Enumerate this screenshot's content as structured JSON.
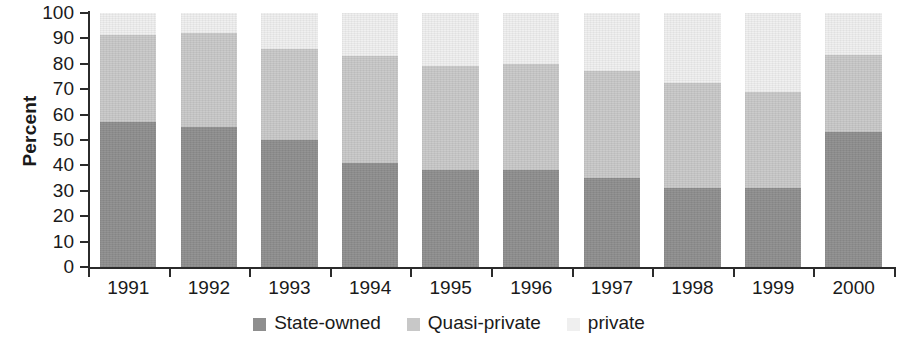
{
  "chart_data": {
    "type": "bar",
    "stacked": true,
    "title": "",
    "subtitle": "",
    "xlabel": "",
    "ylabel": "Percent",
    "ylim": [
      0,
      100
    ],
    "ytick_step": 10,
    "ytick_labels": [
      "100",
      "90",
      "80",
      "70",
      "60",
      "50",
      "40",
      "30",
      "20",
      "10",
      "0"
    ],
    "grid": false,
    "legend_position": "bottom-center",
    "categories": [
      "1991",
      "1992",
      "1993",
      "1994",
      "1995",
      "1996",
      "1997",
      "1998",
      "1999",
      "2000"
    ],
    "series": [
      {
        "name": "State-owned",
        "color": "#8e8e8e",
        "values": [
          57,
          55,
          50,
          41,
          38,
          38,
          35,
          31,
          31,
          53
        ]
      },
      {
        "name": "Quasi-private",
        "color": "#c8c8c8",
        "values": [
          34.5,
          37,
          36,
          42,
          41,
          42,
          42,
          41.5,
          38,
          30.5
        ]
      },
      {
        "name": "private",
        "color": "#efefef",
        "values": [
          8.5,
          8,
          14,
          17,
          21,
          20,
          23,
          27.5,
          31,
          16.5
        ]
      }
    ],
    "cumulative_tops": {
      "state_owned": [
        57,
        55,
        50,
        41,
        38,
        38,
        35,
        31,
        31,
        53
      ],
      "quasi_private_top": [
        91.5,
        92,
        86,
        83,
        79,
        80,
        77,
        72.5,
        69,
        83.5
      ],
      "private_top": [
        100,
        100,
        100,
        100,
        100,
        100,
        100,
        100,
        100,
        100
      ]
    }
  },
  "legend": {
    "items": [
      {
        "label": "State-owned",
        "color": "#8e8e8e"
      },
      {
        "label": "Quasi-private",
        "color": "#c8c8c8"
      },
      {
        "label": "private",
        "color": "#efefef"
      }
    ]
  },
  "axis": {
    "y_title": "Percent"
  }
}
